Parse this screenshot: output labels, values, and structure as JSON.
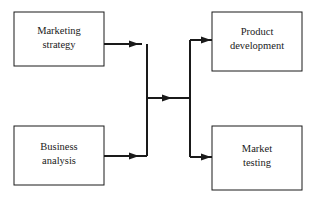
{
  "diagram": {
    "type": "flowchart",
    "background_color": "#ffffff",
    "stroke_color": "#1a1a1a",
    "box_fill_color": "#ffffff",
    "nodes": [
      {
        "id": "marketing-strategy",
        "line1": "Marketing",
        "line2": "strategy",
        "position": "top-left",
        "x": 14,
        "y": 12,
        "width": 90,
        "height": 54
      },
      {
        "id": "business-analysis",
        "line1": "Business",
        "line2": "analysis",
        "position": "bottom-left",
        "x": 14,
        "y": 126,
        "width": 90,
        "height": 59
      },
      {
        "id": "product-development",
        "line1": "Product",
        "line2": "development",
        "position": "top-right",
        "x": 212,
        "y": 12,
        "width": 90,
        "height": 59
      },
      {
        "id": "market-testing",
        "line1": "Market",
        "line2": "testing",
        "position": "bottom-right",
        "x": 212,
        "y": 126,
        "width": 90,
        "height": 64
      }
    ],
    "edges": [
      {
        "id": "marketing-strategy-to-junction",
        "from": "marketing-strategy",
        "to": "left-trunk",
        "arrow": true
      },
      {
        "id": "business-analysis-to-junction",
        "from": "business-analysis",
        "to": "left-trunk",
        "arrow": true
      },
      {
        "id": "junction-to-split",
        "from": "left-trunk",
        "to": "right-trunk",
        "arrow": true
      },
      {
        "id": "split-to-product-development",
        "from": "right-trunk",
        "to": "product-development",
        "arrow": true
      },
      {
        "id": "split-to-market-testing",
        "from": "right-trunk",
        "to": "market-testing",
        "arrow": true
      }
    ]
  }
}
